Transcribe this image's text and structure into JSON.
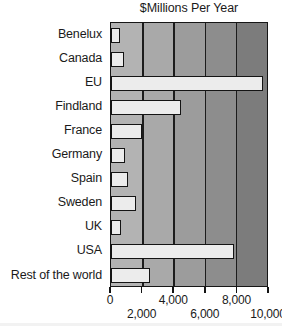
{
  "chart_data": {
    "type": "bar",
    "orientation": "horizontal",
    "title": "$Millions  Per Year",
    "xlabel": "",
    "ylabel": "",
    "xlim": [
      0,
      10000
    ],
    "grid": true,
    "legend": false,
    "categories": [
      "Benelux",
      "Canada",
      "EU",
      "Findland",
      "France",
      "Germany",
      "Spain",
      "Sweden",
      "UK",
      "USA",
      "Rest of the world"
    ],
    "values": [
      580,
      830,
      9750,
      4490,
      1990,
      900,
      1090,
      1600,
      640,
      7880,
      2500
    ],
    "xticks": [
      0,
      2000,
      4000,
      6000,
      8000,
      10000
    ],
    "xtick_labels": [
      "0",
      "2,000",
      "4,000",
      "6,000",
      "8,000",
      "10,000"
    ],
    "bar_fill": "#ececec",
    "bar_edge": "#141414",
    "band_colors": [
      "#b3b3b3",
      "#a9a9a9",
      "#9c9c9c",
      "#8d8d8d",
      "#7c7c7c"
    ]
  }
}
